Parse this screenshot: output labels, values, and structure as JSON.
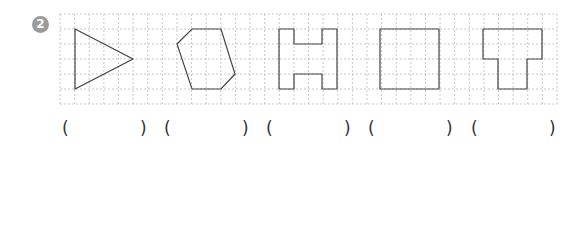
{
  "problem": {
    "number": "2",
    "badge_color": "#9b9b9b"
  },
  "grid": {
    "left": 60,
    "top": 14,
    "right": 557,
    "bottom": 104,
    "cols": 34,
    "rows": 6,
    "line_color": "#c8c8c8",
    "shape_stroke": "#444444"
  },
  "shapes": [
    {
      "name": "triangle",
      "points": "75,29 133,59 75,89"
    },
    {
      "name": "hexagon",
      "points": "192,29 221,29 235,74 221,89 192,89 177,44"
    },
    {
      "name": "h-shape",
      "points": "279,29 294,29 294,44 322,44 322,29 337,29 337,89 322,89 322,74 294,74 294,89 279,89"
    },
    {
      "name": "square",
      "points": "380,29 439,29 439,89 380,89"
    },
    {
      "name": "t-shape",
      "points": "483,29 542,29 542,59 527,59 527,89 498,89 498,59 483,59"
    }
  ],
  "answers": [
    {
      "open": "(",
      "close": ")",
      "open_x": 62,
      "close_x": 140,
      "value": ""
    },
    {
      "open": "(",
      "close": ")",
      "open_x": 164,
      "close_x": 242,
      "value": ""
    },
    {
      "open": "(",
      "close": ")",
      "open_x": 266,
      "close_x": 344,
      "value": ""
    },
    {
      "open": "(",
      "close": ")",
      "open_x": 368,
      "close_x": 446,
      "value": ""
    },
    {
      "open": "(",
      "close": ")",
      "open_x": 471,
      "close_x": 549,
      "value": ""
    }
  ]
}
